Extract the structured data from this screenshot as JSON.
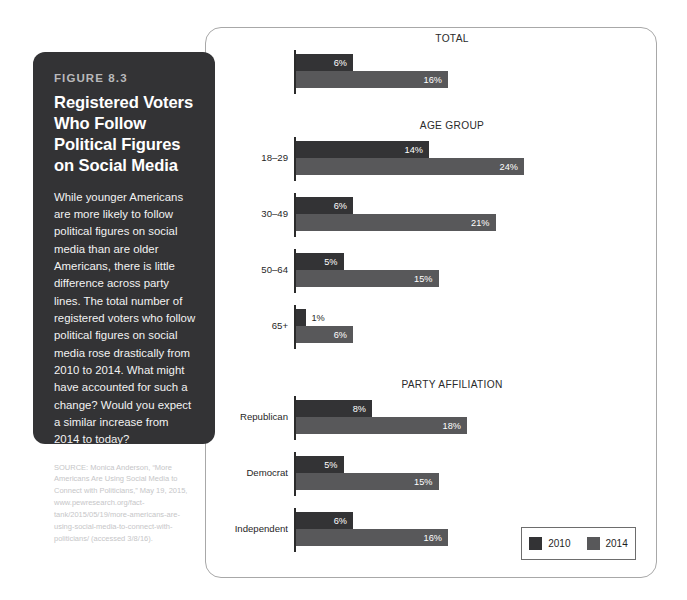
{
  "figure": {
    "number": "FIGURE 8.3",
    "title": "Registered Voters Who Follow Political Figures on Social Media",
    "description": "While younger Americans are more likely to follow political figures on social media than are older Americans, there is little difference across party lines. The total number of registered voters who follow political figures on social media rose drastically from 2010 to 2014. What might have accounted for such a change? Would you expect a similar increase from 2014 to today?",
    "source": "SOURCE: Monica Anderson, “More Americans Are Using Social Media to Connect with Politicians,” May 19, 2015, www.pewresearch.org/fact-tank/2015/05/19/more-americans-are-using-social-media-to-connect-with-politicians/ (accessed 3/8/16)."
  },
  "chart_data": {
    "type": "bar",
    "orientation": "horizontal",
    "title": "Registered Voters Who Follow Political Figures on Social Media",
    "xlabel": "",
    "ylabel": "",
    "xlim": [
      0,
      25
    ],
    "grid": false,
    "value_suffix": "%",
    "legend_position": "bottom-right",
    "series": [
      {
        "name": "2010",
        "color": "#333335"
      },
      {
        "name": "2014",
        "color": "#58585a"
      }
    ],
    "sections": [
      {
        "title": "TOTAL",
        "groups": [
          {
            "label": "",
            "values": [
              6,
              16
            ],
            "labels": [
              "6%",
              "16%"
            ]
          }
        ]
      },
      {
        "title": "AGE GROUP",
        "groups": [
          {
            "label": "18–29",
            "values": [
              14,
              24
            ],
            "labels": [
              "14%",
              "24%"
            ]
          },
          {
            "label": "30–49",
            "values": [
              6,
              21
            ],
            "labels": [
              "6%",
              "21%"
            ]
          },
          {
            "label": "50–64",
            "values": [
              5,
              15
            ],
            "labels": [
              "5%",
              "15%"
            ]
          },
          {
            "label": "65+",
            "values": [
              1,
              6
            ],
            "labels": [
              "1%",
              "6%"
            ]
          }
        ]
      },
      {
        "title": "PARTY AFFILIATION",
        "groups": [
          {
            "label": "Republican",
            "values": [
              8,
              18
            ],
            "labels": [
              "8%",
              "18%"
            ]
          },
          {
            "label": "Democrat",
            "values": [
              5,
              15
            ],
            "labels": [
              "5%",
              "15%"
            ]
          },
          {
            "label": "Independent",
            "values": [
              6,
              16
            ],
            "labels": [
              "6%",
              "16%"
            ]
          }
        ]
      }
    ]
  },
  "legend": {
    "items": [
      {
        "label": "2010",
        "color": "#333335"
      },
      {
        "label": "2014",
        "color": "#58585a"
      }
    ]
  }
}
